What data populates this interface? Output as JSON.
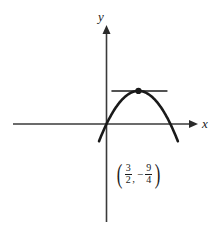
{
  "figure": {
    "background_color": "#ffffff",
    "curve_color": "#1a1a1a",
    "axis_color": "#3a3a3a"
  },
  "axes": {
    "x_label": "x",
    "y_label": "y",
    "x_label_name": "x-axis-label",
    "y_label_name": "y-axis-label"
  },
  "vertex": {
    "x_numerator": "3",
    "x_denominator": "2",
    "y_numerator": "9",
    "y_denominator": "4",
    "sign": "−",
    "comma": ",",
    "open_paren": "(",
    "close_paren": ")",
    "label_text": "(3/2, −9/4)"
  },
  "chart_data": {
    "type": "line",
    "title": "",
    "xlabel": "x",
    "ylabel": "y",
    "grid": false,
    "legend": false,
    "function": "y = x^2 - 3x",
    "vertex": [
      1.5,
      -2.25
    ],
    "x_intercepts": [
      0,
      3
    ],
    "xlim": [
      -3.1,
      4.3
    ],
    "ylim": [
      -3.6,
      4.7
    ],
    "x": [
      -0.35,
      0,
      0.5,
      1,
      1.5,
      2,
      2.5,
      3,
      3.35
    ],
    "values": [
      1.1725,
      0,
      -1.25,
      -2,
      -2.25,
      -2,
      -1.25,
      0,
      1.1725
    ]
  }
}
